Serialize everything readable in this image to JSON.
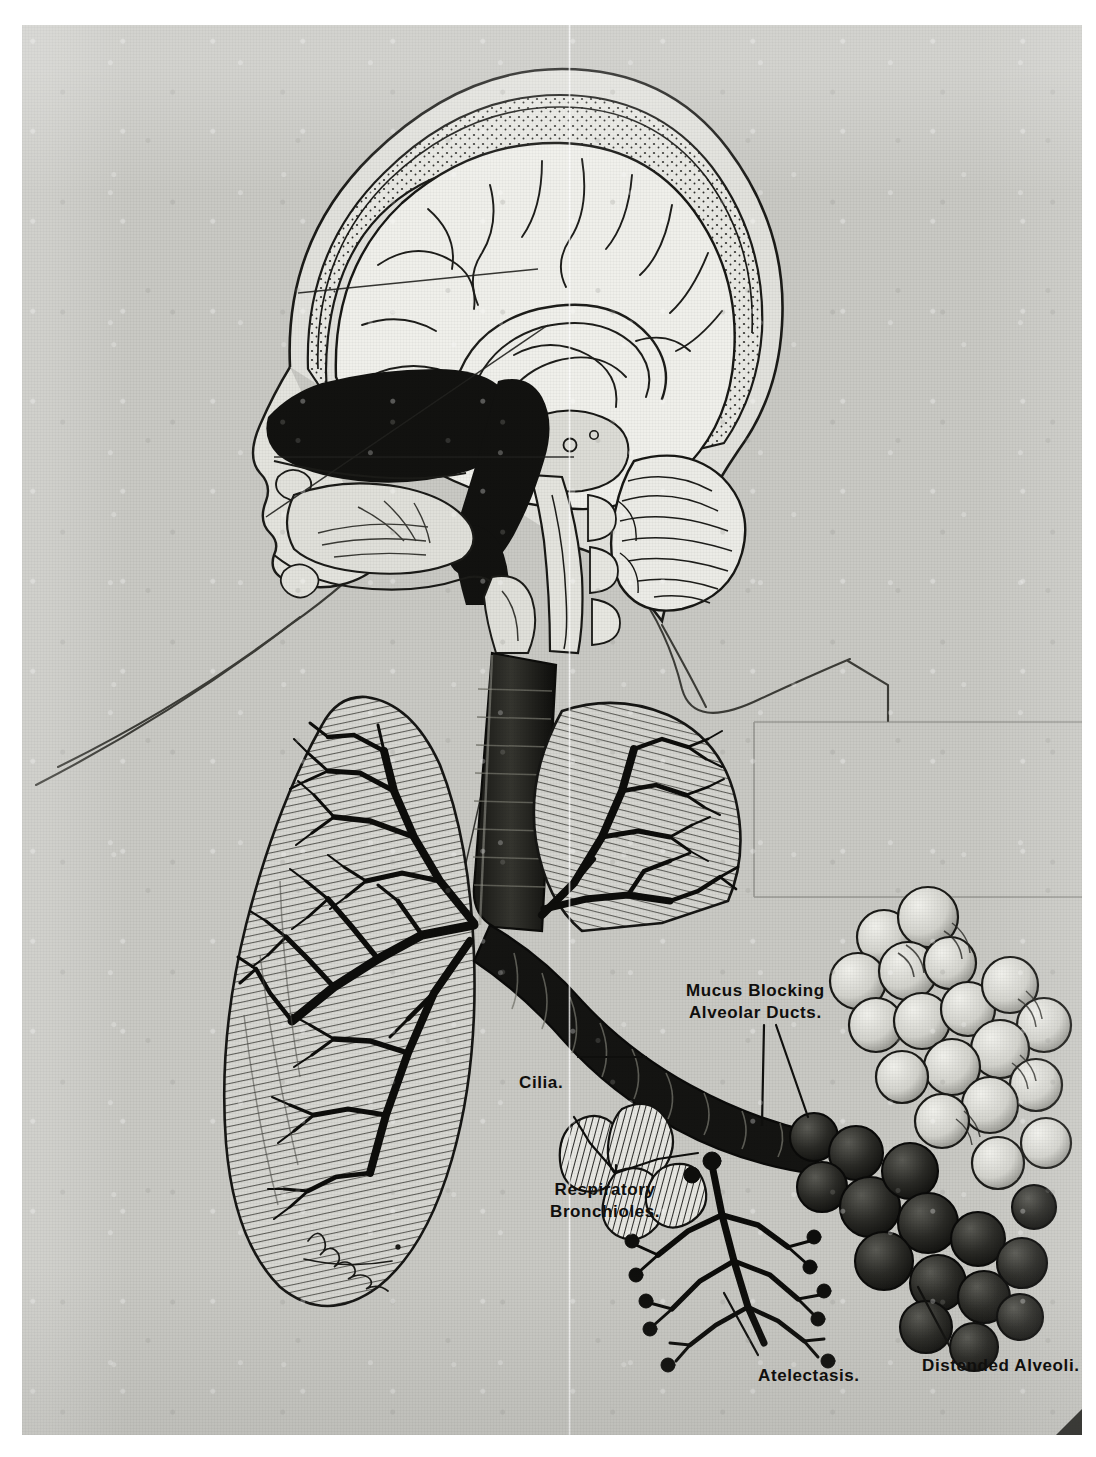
{
  "plate": {
    "kind": "anatomical-illustration",
    "subject": "Mid-sagittal head and respiratory tract with enlarged bronchiole and alveoli detail",
    "medium": "halftone print on gray paper",
    "signature": "illegible cursive artist signature",
    "background_color": "#c9c9c4",
    "ink_color": "#100f0d",
    "margin_color": "#ffffff"
  },
  "labels": {
    "mucus_line1": "Mucus Blocking",
    "mucus_line2": "Alveolar Ducts.",
    "cilia": "Cilia.",
    "respiratory_line1": "Respiratory",
    "respiratory_line2": "Bronchioles.",
    "atelectasis": "Atelectasis.",
    "distended": "Distended Alveoli."
  },
  "structures": [
    "cranium",
    "cerebrum",
    "cerebellum",
    "brainstem",
    "nasal cavity",
    "oral cavity",
    "tongue",
    "pharynx",
    "larynx",
    "trachea",
    "left lung",
    "right lung",
    "bronchial tree",
    "respiratory bronchioles",
    "alveolar clusters",
    "distended alveoli",
    "atelectatic alveoli"
  ]
}
